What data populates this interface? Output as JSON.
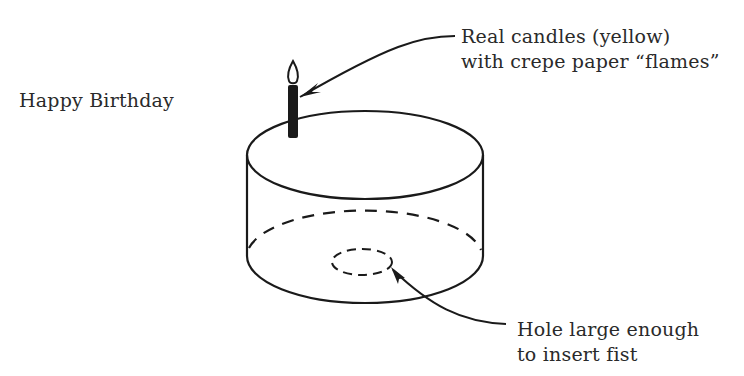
{
  "title": "Happy Birthday",
  "annotations": {
    "candles": {
      "line1": "Real candles (yellow)",
      "line2": "with crepe paper “flames”"
    },
    "hole": {
      "line1": "Hole large enough",
      "line2": "to insert fist"
    }
  },
  "colors": {
    "ink": "#1a1a1a",
    "background": "#ffffff"
  }
}
